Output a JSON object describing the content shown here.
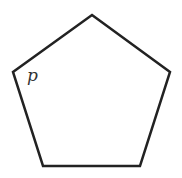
{
  "diagram": {
    "shape": "pentagon",
    "stroke_color": "#222222",
    "stroke_width": 2.5,
    "fill_color": "#ffffff",
    "vertices": [
      [
        92,
        15
      ],
      [
        170,
        72
      ],
      [
        140,
        166
      ],
      [
        43,
        166
      ],
      [
        13,
        72
      ]
    ],
    "points": "92,15 170,72 140,166 43,166 13,72",
    "vertex_label": {
      "text": "p",
      "x": 27,
      "y": 67,
      "color": "#333333"
    }
  }
}
